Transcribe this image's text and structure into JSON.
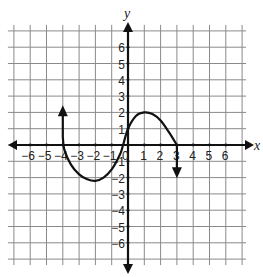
{
  "chart_data": {
    "type": "line",
    "title": "",
    "xlabel": "x",
    "ylabel": "y",
    "xlim": [
      -7,
      7
    ],
    "ylim": [
      -7,
      7
    ],
    "grid": true,
    "x_ticks": [
      -6,
      -5,
      -4,
      -3,
      -2,
      -1,
      0,
      1,
      2,
      3,
      4,
      5,
      6
    ],
    "y_ticks": [
      -6,
      -5,
      -4,
      -3,
      -2,
      -1,
      1,
      2,
      3,
      4,
      5,
      6
    ],
    "x_tick_labels": [
      "−6",
      "−5",
      "−4",
      "−3",
      "−2",
      "−1",
      "0",
      "1",
      "2",
      "3",
      "4",
      "5",
      "6"
    ],
    "y_tick_labels": [
      "−6",
      "−5",
      "−4",
      "−3",
      "−2",
      "−1",
      "1",
      "2",
      "3",
      "4",
      "5",
      "6"
    ],
    "series": [
      {
        "name": "f(x)",
        "description": "Curve with arrows at both ends: vertical arrow up at x=-4 to y≈2, down through (-4,0), minimum near (-2,-2.2), up through (0,1), maximum at (1,2), down through (3,0), vertical arrow down at x=3 to y≈-1.8",
        "points": [
          [
            -4,
            2.2
          ],
          [
            -4,
            0.5
          ],
          [
            -3.9,
            -0.3
          ],
          [
            -3.5,
            -1.2
          ],
          [
            -3,
            -1.8
          ],
          [
            -2.5,
            -2.1
          ],
          [
            -2,
            -2.2
          ],
          [
            -1.5,
            -2.0
          ],
          [
            -1,
            -1.5
          ],
          [
            -0.5,
            -0.6
          ],
          [
            -0.3,
            0
          ],
          [
            0,
            1
          ],
          [
            0.5,
            1.8
          ],
          [
            1,
            2
          ],
          [
            1.5,
            1.9
          ],
          [
            2,
            1.5
          ],
          [
            2.5,
            0.8
          ],
          [
            3,
            0
          ],
          [
            3,
            -1.8
          ]
        ],
        "key_points": {
          "left_end_arrow": [
            -4,
            2.2
          ],
          "x_intercepts": [
            -4,
            -0.3,
            3
          ],
          "local_min": [
            -2,
            -2.2
          ],
          "y_intercept": [
            0,
            1
          ],
          "local_max": [
            1,
            2
          ],
          "right_end_arrow": [
            3,
            -1.8
          ]
        }
      }
    ]
  }
}
